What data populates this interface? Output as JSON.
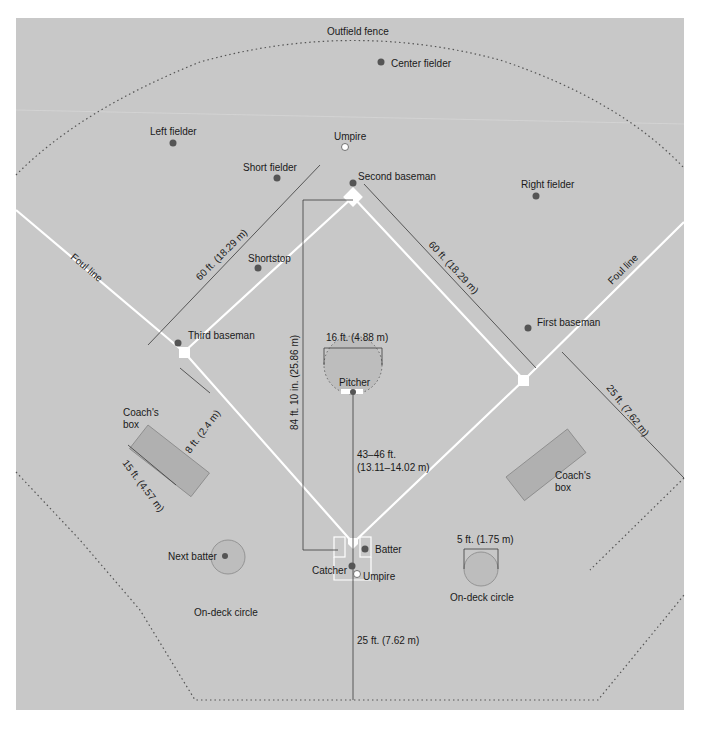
{
  "diagram": {
    "colors": {
      "field": "#c8c8c8",
      "lines": "#ffffff",
      "player": "#555555",
      "umpire": "#ffffff",
      "box": "#b0b0b0",
      "circle": "#bdbdbd"
    },
    "labels": {
      "outfield_fence": "Outfield fence",
      "center_fielder": "Center fielder",
      "left_fielder": "Left fielder",
      "right_fielder": "Right fielder",
      "umpire_field": "Umpire",
      "short_fielder": "Short fielder",
      "second_baseman": "Second baseman",
      "shortstop": "Shortstop",
      "third_baseman": "Third baseman",
      "first_baseman": "First baseman",
      "pitcher": "Pitcher",
      "batter": "Batter",
      "catcher": "Catcher",
      "umpire_home": "Umpire",
      "next_batter": "Next batter",
      "on_deck_left": "On-deck circle",
      "on_deck_right": "On-deck circle",
      "coach_box_left_1": "Coach's",
      "coach_box_left_2": "box",
      "coach_box_right_1": "Coach's",
      "coach_box_right_2": "box",
      "foul_line_left": "Foul line",
      "foul_line_right": "Foul line"
    },
    "dimensions": {
      "third_to_second": "60 ft. (18.29 m)",
      "first_to_second": "60 ft. (18.29 m)",
      "home_to_second": "84 ft. 10 in. (25.86 m)",
      "pitcher_circle": "16 ft. (4.88 m)",
      "pitching_distance_1": "43–46 ft.",
      "pitching_distance_2": "(13.11–14.02 m)",
      "coach_box_width": "8 ft. (2.4 m)",
      "coach_box_length": "15 ft. (4.57 m)",
      "foul_territory_side": "25 ft. (7.62 m)",
      "backstop": "25 ft. (7.62 m)",
      "on_deck_circle": "5 ft. (1.75 m)"
    }
  }
}
